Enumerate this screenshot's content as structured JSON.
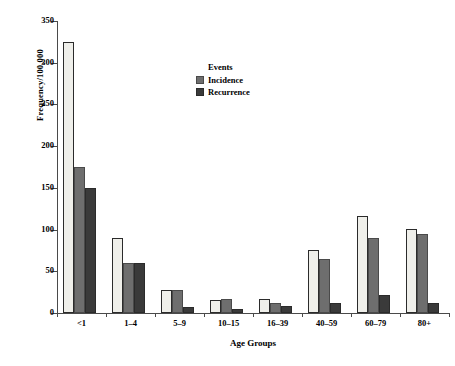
{
  "chart_data": {
    "type": "bar",
    "title": "",
    "xlabel": "Age Groups",
    "ylabel": "Frequency/100,000",
    "categories": [
      "<1",
      "1–4",
      "5–9",
      "10–15",
      "16–39",
      "40–59",
      "60–79",
      "80+"
    ],
    "series": [
      {
        "name": "",
        "values": [
          325,
          90,
          28,
          16,
          17,
          75,
          116,
          101
        ]
      },
      {
        "name": "Incidence",
        "values": [
          175,
          60,
          28,
          17,
          12,
          65,
          90,
          95
        ]
      },
      {
        "name": "Recurrence",
        "values": [
          150,
          60,
          7,
          5,
          8,
          12,
          22,
          12
        ]
      }
    ],
    "ylim": [
      0,
      350
    ],
    "yticks": [
      0,
      50,
      100,
      150,
      200,
      250,
      300,
      350
    ],
    "grid": false,
    "legend": {
      "title": "Events",
      "position": "inside-top-center",
      "entries": [
        {
          "label": "Incidence",
          "color": "#6e6e6e"
        },
        {
          "label": "Recurrence",
          "color": "#3a3a3a"
        }
      ]
    },
    "colors": {
      "series_0": "#efefea",
      "series_1": "#6e6e6e",
      "series_2": "#3a3a3a",
      "axis": "#4a4a4a",
      "background": "#ffffff"
    }
  }
}
